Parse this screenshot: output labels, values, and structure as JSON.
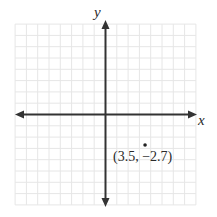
{
  "chart_data": {
    "type": "scatter",
    "title": "",
    "xlabel": "x",
    "ylabel": "y",
    "xlim": [
      -8,
      8
    ],
    "ylim": [
      -8,
      8
    ],
    "grid": true,
    "grid_step": 1,
    "tick_labels": false,
    "points": [
      {
        "x": 3.5,
        "y": -2.7,
        "label": "(3.5, −2.7)"
      }
    ]
  },
  "axes": {
    "x_label": "x",
    "y_label": "y"
  },
  "point": {
    "label": "(3.5, −2.7)"
  },
  "colors": {
    "grid": "#e6e6e6",
    "axis": "#333333",
    "text": "#2a2a2a"
  }
}
